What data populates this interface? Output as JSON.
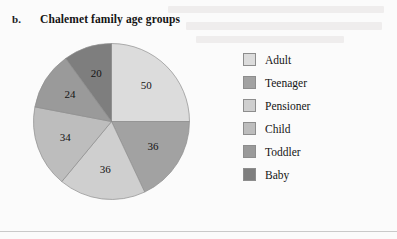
{
  "item_marker": "b.",
  "chart_data": {
    "type": "pie",
    "title": "Chalemet family age groups",
    "categories": [
      "Adult",
      "Teenager",
      "Pensioner",
      "Child",
      "Toddler",
      "Baby"
    ],
    "values": [
      50,
      36,
      36,
      34,
      24,
      20
    ],
    "total": 200,
    "start_angle_deg": 0,
    "direction": "clockwise",
    "legend_position": "right",
    "grid": false,
    "xlabel": "",
    "ylabel": "",
    "colors": [
      "#dcdcdc",
      "#a2a2a2",
      "#cfcfcf",
      "#bdbdbd",
      "#9a9a9a",
      "#7e7e7e"
    ],
    "slice_labels": [
      "50",
      "36",
      "36",
      "34",
      "24",
      "20"
    ]
  },
  "legend": {
    "items": [
      {
        "label": "Adult",
        "color": "#dcdcdc"
      },
      {
        "label": "Teenager",
        "color": "#a2a2a2"
      },
      {
        "label": "Pensioner",
        "color": "#cfcfcf"
      },
      {
        "label": "Child",
        "color": "#bdbdbd"
      },
      {
        "label": "Toddler",
        "color": "#9a9a9a"
      },
      {
        "label": "Baby",
        "color": "#7e7e7e"
      }
    ]
  }
}
